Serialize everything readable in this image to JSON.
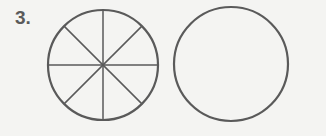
{
  "problem": {
    "number_label": "3.",
    "figures": [
      {
        "name": "divided-circle",
        "center": [
          103,
          65
        ],
        "radius": 55,
        "divisions": 8,
        "stroke": "#5a5a5a"
      },
      {
        "name": "blank-circle",
        "center": [
          231,
          64
        ],
        "radius": 57,
        "divisions": 0,
        "stroke": "#5a5a5a"
      }
    ]
  }
}
